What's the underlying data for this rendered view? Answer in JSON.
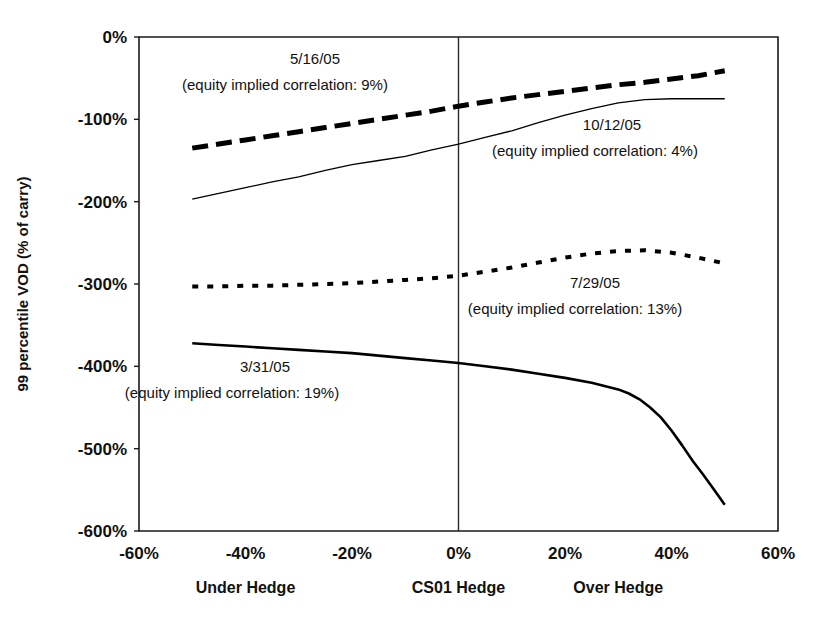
{
  "chart_data": {
    "type": "line",
    "title": "",
    "xlabel": "",
    "ylabel": "99 percentile VOD (% of carry)",
    "xlim": [
      -60,
      60
    ],
    "ylim": [
      -600,
      0
    ],
    "grid": false,
    "legend_position": "inline-annotations",
    "x_ticks": [
      "-60%",
      "-40%",
      "-20%",
      "0%",
      "20%",
      "40%",
      "60%"
    ],
    "x_tick_values": [
      -60,
      -40,
      -20,
      0,
      20,
      40,
      60
    ],
    "y_ticks": [
      "0%",
      "-100%",
      "-200%",
      "-300%",
      "-400%",
      "-500%",
      "-600%"
    ],
    "y_tick_values": [
      0,
      -100,
      -200,
      -300,
      -400,
      -500,
      -600
    ],
    "region_labels": [
      {
        "text": "Under Hedge",
        "x": -40
      },
      {
        "text": "CS01 Hedge",
        "x": 0
      },
      {
        "text": "Over Hedge",
        "x": 30
      }
    ],
    "reference_lines": [
      {
        "orientation": "vertical",
        "value": 0
      }
    ],
    "series": [
      {
        "name": "5/16/05",
        "equity_implied_correlation": "9%",
        "annotation_line1": "5/16/05",
        "annotation_line2": "(equity implied correlation: 9%)",
        "style": "thick-dashed",
        "stroke_width": 5,
        "dash_array": "16 8",
        "x": [
          -50,
          -45,
          -40,
          -35,
          -30,
          -25,
          -20,
          -15,
          -10,
          -5,
          0,
          5,
          10,
          15,
          20,
          25,
          30,
          35,
          40,
          45,
          50
        ],
        "y": [
          -135,
          -130,
          -125,
          -120,
          -115,
          -110,
          -105,
          -100,
          -95,
          -90,
          -84,
          -79,
          -74,
          -70,
          -66,
          -62,
          -58,
          -55,
          -51,
          -47,
          -41
        ]
      },
      {
        "name": "10/12/05",
        "equity_implied_correlation": "4%",
        "annotation_line1": "10/12/05",
        "annotation_line2": "(equity implied correlation: 4%)",
        "style": "thin-solid",
        "stroke_width": 1.3,
        "dash_array": "none",
        "x": [
          -50,
          -45,
          -40,
          -35,
          -30,
          -25,
          -20,
          -15,
          -10,
          -5,
          0,
          5,
          10,
          15,
          20,
          25,
          30,
          35,
          40,
          45,
          50
        ],
        "y": [
          -197,
          -190,
          -183,
          -176,
          -170,
          -162,
          -155,
          -150,
          -145,
          -137,
          -130,
          -122,
          -114,
          -104,
          -95,
          -87,
          -80,
          -76,
          -75,
          -75,
          -75
        ]
      },
      {
        "name": "7/29/05",
        "equity_implied_correlation": "13%",
        "annotation_line1": "7/29/05",
        "annotation_line2": "(equity implied correlation: 13%)",
        "style": "fine-dotted",
        "stroke_width": 4,
        "dash_array": "6 9",
        "x": [
          -50,
          -45,
          -40,
          -35,
          -30,
          -25,
          -20,
          -15,
          -10,
          -5,
          0,
          5,
          10,
          15,
          20,
          25,
          30,
          35,
          40,
          45,
          50
        ],
        "y": [
          -303,
          -303,
          -302,
          -302,
          -301,
          -300,
          -299,
          -297,
          -295,
          -293,
          -290,
          -285,
          -280,
          -274,
          -268,
          -263,
          -260,
          -259,
          -262,
          -268,
          -275
        ]
      },
      {
        "name": "3/31/05",
        "equity_implied_correlation": "19%",
        "annotation_line1": "3/31/05",
        "annotation_line2": "(equity implied correlation: 19%)",
        "style": "solid",
        "stroke_width": 2.6,
        "dash_array": "none",
        "x": [
          -50,
          -45,
          -40,
          -35,
          -30,
          -25,
          -20,
          -15,
          -10,
          -5,
          0,
          5,
          10,
          15,
          20,
          25,
          30,
          32,
          34,
          36,
          38,
          40,
          42,
          44,
          46,
          48,
          50
        ],
        "y": [
          -372,
          -374,
          -376,
          -378,
          -380,
          -382,
          -384,
          -387,
          -390,
          -393,
          -396,
          -400,
          -404,
          -409,
          -414,
          -420,
          -428,
          -433,
          -440,
          -450,
          -462,
          -478,
          -496,
          -515,
          -532,
          -550,
          -568
        ]
      }
    ],
    "annotations": [
      {
        "series": "5/16/05",
        "line1_x": 315,
        "line1_y": 64,
        "line2_x": 285,
        "line2_y": 90
      },
      {
        "series": "10/12/05",
        "line1_x": 612,
        "line1_y": 130,
        "line2_x": 595,
        "line2_y": 156
      },
      {
        "series": "7/29/05",
        "line1_x": 595,
        "line1_y": 288,
        "line2_x": 575,
        "line2_y": 314
      },
      {
        "series": "3/31/05",
        "line1_x": 265,
        "line1_y": 372,
        "line2_x": 232,
        "line2_y": 398
      }
    ]
  },
  "plot_geometry": {
    "left": 139,
    "right": 778,
    "top": 37,
    "bottom": 531
  }
}
